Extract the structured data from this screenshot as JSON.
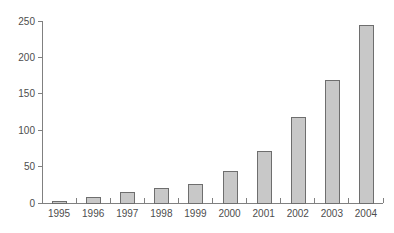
{
  "chart_data": {
    "type": "bar",
    "title": "",
    "subtitle": "",
    "xlabel": "",
    "ylabel": "",
    "categories": [
      "1995",
      "1996",
      "1997",
      "1998",
      "1999",
      "2000",
      "2001",
      "2002",
      "2003",
      "2004"
    ],
    "values": [
      3,
      8,
      15,
      20,
      26,
      44,
      72,
      118,
      169,
      244
    ],
    "ylim": [
      0,
      250
    ],
    "yticks": [
      0,
      50,
      100,
      150,
      200,
      250
    ],
    "ytick_labels": [
      "0",
      "50",
      "100",
      "150",
      "200",
      "250"
    ],
    "grid": false,
    "legend": false,
    "legend_position": "none",
    "annotations": [],
    "style": {
      "bar_fill": "#c8c8c8",
      "bar_stroke": "#6e6e6e",
      "axis_color": "#808080",
      "text_color": "#4d4d4d",
      "background": "#ffffff"
    }
  }
}
